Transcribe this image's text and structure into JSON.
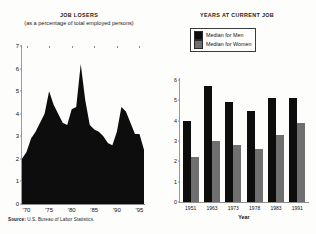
{
  "left": {
    "title": "JOB LOSERS",
    "subtitle": "(as a percentage of total employed persons)",
    "source_prefix": "Source:",
    "source_text": " U.S. Bureau of Labor Statistics."
  },
  "right": {
    "title": "YEARS AT CURRENT JOB",
    "legend": [
      {
        "label": "Median for Men",
        "color": "#0d0d0d",
        "swatch_name": "legend-swatch-men"
      },
      {
        "label": "Median for Women",
        "color": "#6f6f6f",
        "swatch_name": "legend-swatch-women"
      }
    ],
    "xlabel": "Year"
  },
  "chart_data": [
    {
      "type": "area",
      "title": "JOB LOSERS",
      "subtitle": "(as a percentage of total employed persons)",
      "xlabel": "",
      "ylabel": "",
      "ylim": [
        0,
        7
      ],
      "yticks": [
        0,
        1,
        2,
        3,
        4,
        5,
        6,
        7
      ],
      "ytick_labels": [
        "0",
        "1",
        "2",
        "3",
        "4",
        "5",
        "6",
        "7"
      ],
      "xlim": [
        1969,
        1996
      ],
      "xticks": [
        1970,
        1975,
        1980,
        1985,
        1990,
        1995
      ],
      "xtick_labels": [
        "'70",
        "'75",
        "'80",
        "'85",
        "'90",
        "'95"
      ],
      "grid": false,
      "fill_color": "#0d0d0d",
      "x": [
        1969,
        1970,
        1971,
        1972,
        1973,
        1974,
        1975,
        1976,
        1977,
        1978,
        1979,
        1980,
        1981,
        1982,
        1983,
        1984,
        1985,
        1986,
        1987,
        1988,
        1989,
        1990,
        1991,
        1992,
        1993,
        1994,
        1995,
        1996
      ],
      "values": [
        2.0,
        2.3,
        2.9,
        3.2,
        3.6,
        4.0,
        5.0,
        4.4,
        4.0,
        3.6,
        3.5,
        4.2,
        4.3,
        6.2,
        4.6,
        3.5,
        3.3,
        3.2,
        3.0,
        2.7,
        2.6,
        3.2,
        4.3,
        4.1,
        3.6,
        3.1,
        3.1,
        2.4
      ]
    },
    {
      "type": "bar",
      "title": "YEARS AT CURRENT JOB",
      "xlabel": "Year",
      "ylabel": "",
      "ylim": [
        0,
        6
      ],
      "yticks": [
        0,
        1,
        2,
        3,
        4,
        5,
        6
      ],
      "ytick_labels": [
        "0",
        "1",
        "2",
        "3",
        "4",
        "5",
        "6"
      ],
      "categories": [
        "1951",
        "1963",
        "1973",
        "1978",
        "1983",
        "1991"
      ],
      "grid": false,
      "legend_position": "top-center",
      "series": [
        {
          "name": "Median for Men",
          "color": "#0d0d0d",
          "values": [
            4.0,
            5.7,
            4.9,
            4.5,
            5.1,
            5.1
          ]
        },
        {
          "name": "Median for Women",
          "color": "#6f6f6f",
          "values": [
            2.2,
            3.0,
            2.8,
            2.6,
            3.3,
            3.9
          ]
        }
      ]
    }
  ]
}
